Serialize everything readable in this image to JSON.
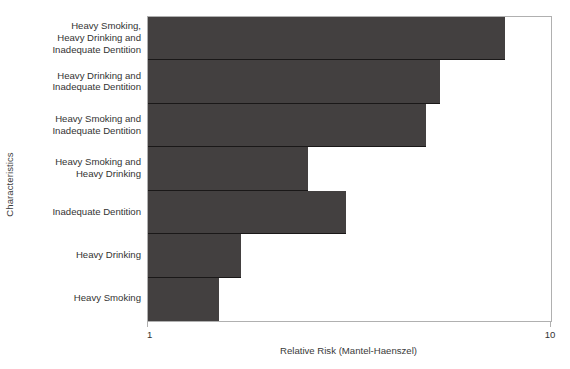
{
  "chart_data": {
    "type": "bar",
    "orientation": "horizontal",
    "title": "",
    "xlabel": "Relative Risk (Mantel-Haenszel)",
    "ylabel": "Characteristics",
    "xscale": "log",
    "xlim": [
      1,
      10
    ],
    "xticks": [
      1,
      10
    ],
    "xticklabels": [
      "1",
      "10"
    ],
    "grid": false,
    "legend": null,
    "bar_color": "#434040",
    "axis_color": "#b0b0b0",
    "categories": [
      "Heavy Smoking,\nHeavy Drinking and\nInadequate Dentition",
      "Heavy Drinking and\nInadequate Dentition",
      "Heavy Smoking and\nInadequate Dentition",
      "Heavy Smoking and\nHeavy Drinking",
      "Inadequate Dentition",
      "Heavy Drinking",
      "Heavy Smoking"
    ],
    "values": [
      7.7,
      5.3,
      4.9,
      2.5,
      3.1,
      1.7,
      1.5
    ],
    "series": [
      {
        "name": "Relative Risk (Mantel-Haenszel)",
        "values": [
          7.7,
          5.3,
          4.9,
          2.5,
          3.1,
          1.7,
          1.5
        ]
      }
    ]
  },
  "axes": {
    "x_title": "Relative Risk (Mantel-Haenszel)",
    "y_title": "Characteristics",
    "x_tick_min": "1",
    "x_tick_max": "10"
  }
}
